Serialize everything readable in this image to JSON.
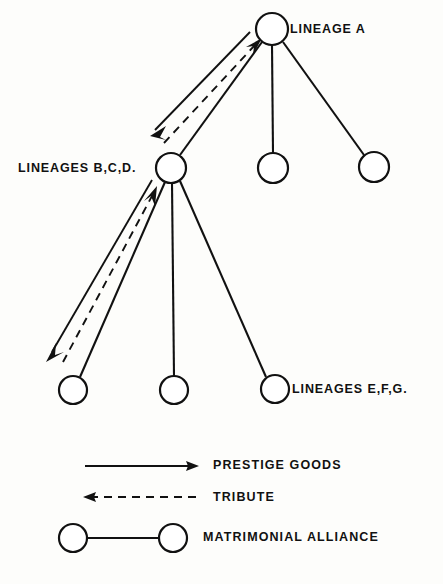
{
  "diagram": {
    "background_color": "#fdfdfb",
    "ink_color": "#111111",
    "nodes": [
      {
        "id": "a",
        "label": "LINEAGE A",
        "cx": 272,
        "cy": 29,
        "r": 16
      },
      {
        "id": "bcd",
        "label": "LINEAGES B,C,D.",
        "cx": 171,
        "cy": 168,
        "r": 15
      },
      {
        "id": "a2",
        "label": "",
        "cx": 273,
        "cy": 168,
        "r": 15
      },
      {
        "id": "a3",
        "label": "",
        "cx": 374,
        "cy": 167,
        "r": 15
      },
      {
        "id": "e",
        "label": "",
        "cx": 73,
        "cy": 390,
        "r": 14
      },
      {
        "id": "f",
        "label": "",
        "cx": 174,
        "cy": 390,
        "r": 14
      },
      {
        "id": "g",
        "label": "LINEAGES E,F,G.",
        "cx": 275,
        "cy": 389,
        "r": 14
      }
    ],
    "labels": {
      "lineage_a": "LINEAGE A",
      "lineages_bcd": "LINEAGES B,C,D.",
      "lineages_efg": "LINEAGES E,F,G."
    },
    "relations": [
      {
        "type": "matrimonial-alliance",
        "from": "a",
        "to": "bcd"
      },
      {
        "type": "matrimonial-alliance",
        "from": "a",
        "to": "a2"
      },
      {
        "type": "matrimonial-alliance",
        "from": "a",
        "to": "a3"
      },
      {
        "type": "matrimonial-alliance",
        "from": "bcd",
        "to": "e"
      },
      {
        "type": "matrimonial-alliance",
        "from": "bcd",
        "to": "f"
      },
      {
        "type": "matrimonial-alliance",
        "from": "bcd",
        "to": "g"
      },
      {
        "type": "prestige-goods",
        "from": "a",
        "to": "bcd"
      },
      {
        "type": "prestige-goods",
        "from": "bcd",
        "to": "e"
      },
      {
        "type": "tribute",
        "from": "bcd",
        "to": "a"
      },
      {
        "type": "tribute",
        "from": "e",
        "to": "bcd"
      }
    ]
  },
  "legend": {
    "items": [
      {
        "key": "prestige",
        "label": "PRESTIGE GOODS",
        "symbol": "solid-arrow-right"
      },
      {
        "key": "tribute",
        "label": "TRIBUTE",
        "symbol": "dashed-arrow-left"
      },
      {
        "key": "alliance",
        "label": "MATRIMONIAL ALLIANCE",
        "symbol": "two-circles-joined"
      }
    ]
  }
}
